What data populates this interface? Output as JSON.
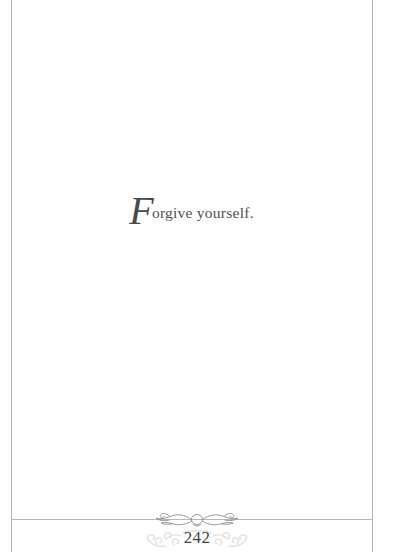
{
  "page": {
    "background_color": "#ffffff",
    "rule_color": "#b3b3b3"
  },
  "quote": {
    "initial": "F",
    "rest": "orgive yourself.",
    "full_text": "Forgive yourself.",
    "text_color": "#4f4f52"
  },
  "footer": {
    "divider_ornament": "flourish-ornament",
    "folio_ornament": "scrollwork-watermark",
    "page_number": "242",
    "page_number_color": "#3f3f42"
  }
}
